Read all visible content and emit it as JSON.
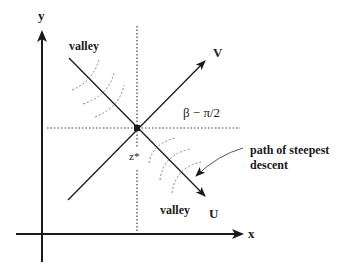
{
  "diagram": {
    "axes": {
      "x_label": "x",
      "y_label": "y"
    },
    "directions": {
      "v_label": "V",
      "u_label": "U"
    },
    "saddle_point_label": "z*",
    "angle_label": "β − π/2",
    "valley_top_label": "valley",
    "valley_bottom_label": "valley",
    "annotation": {
      "line1": "path of steepest",
      "line2": "descent"
    },
    "colors": {
      "ink": "#1a1a1a",
      "dotted": "#444444",
      "arcs": "#888888"
    }
  }
}
